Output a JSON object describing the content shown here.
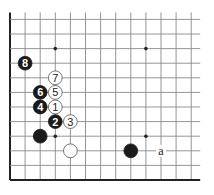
{
  "diagram": {
    "type": "go-board-corner",
    "grid": {
      "columns": 13,
      "rows": 12,
      "origin_x": 10,
      "bottom_y": 180,
      "col_spacing": 15.1,
      "row_spacing": 14.6,
      "left_edge": true,
      "bottom_edge": true
    },
    "star_points": [
      {
        "col": 3,
        "row": 3
      },
      {
        "col": 9,
        "row": 3
      },
      {
        "col": 3,
        "row": 9
      },
      {
        "col": 9,
        "row": 9
      }
    ],
    "stones": [
      {
        "color": "black",
        "col": 2,
        "row": 3,
        "label": ""
      },
      {
        "color": "white",
        "col": 4,
        "row": 2,
        "label": ""
      },
      {
        "color": "black",
        "col": 8,
        "row": 2,
        "label": ""
      },
      {
        "color": "white",
        "col": 3,
        "row": 5,
        "label": "1"
      },
      {
        "color": "black",
        "col": 3,
        "row": 4,
        "label": "2"
      },
      {
        "color": "white",
        "col": 4,
        "row": 4,
        "label": "3"
      },
      {
        "color": "black",
        "col": 2,
        "row": 5,
        "label": "4"
      },
      {
        "color": "white",
        "col": 3,
        "row": 6,
        "label": "5"
      },
      {
        "color": "black",
        "col": 2,
        "row": 6,
        "label": "6"
      },
      {
        "color": "white",
        "col": 3,
        "row": 7,
        "label": "7"
      },
      {
        "color": "black",
        "col": 1,
        "row": 8,
        "label": "8"
      }
    ],
    "markers": [
      {
        "col": 10,
        "row": 2,
        "label": "a"
      }
    ],
    "colors": {
      "line": "#8a8a8a",
      "edge": "#222222",
      "black_stone": "#1a1a1a",
      "white_stone": "#ffffff",
      "white_outline": "#555555"
    }
  }
}
